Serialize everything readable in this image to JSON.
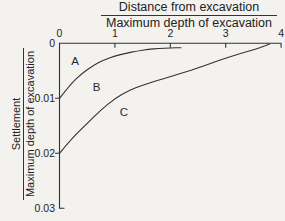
{
  "figure": {
    "x_axis_title_numerator": "Distance from excavation",
    "x_axis_title_denominator": "Maximum depth of excavation",
    "y_axis_title_numerator": "Settlement",
    "y_axis_title_denominator": "Maximum depth of excavation"
  },
  "colors": {
    "background": "#f3f2ef",
    "line": "#333333",
    "text": "#222222"
  },
  "chart_data": {
    "type": "line",
    "xlabel": "Distance from excavation / Maximum depth of excavation",
    "ylabel": "Settlement / Maximum depth of excavation",
    "xlim": [
      0,
      4
    ],
    "ylim": [
      0,
      0.03
    ],
    "x_axis_position": "top",
    "y_axis_inverted": true,
    "grid": false,
    "legend": "none",
    "x_tick_values": [
      0,
      1,
      2,
      3,
      4
    ],
    "x_tick_labels": [
      "0",
      "1",
      "2",
      "3",
      "4"
    ],
    "y_tick_values": [
      0,
      0.01,
      0.02,
      0.03
    ],
    "y_tick_labels": [
      "0",
      "0.01",
      "0.02",
      "0.03"
    ],
    "x_ticks_with_marks": [
      1,
      2,
      3,
      4
    ],
    "y_ticks_with_marks": [
      0.01,
      0.02
    ],
    "series": [
      {
        "name": "zone-boundary-A-B",
        "points": [
          [
            0,
            0.01
          ],
          [
            0.2,
            0.0074
          ],
          [
            0.4,
            0.0055
          ],
          [
            0.6,
            0.0041
          ],
          [
            0.8,
            0.003
          ],
          [
            1.0,
            0.0023
          ],
          [
            1.2,
            0.0018
          ],
          [
            1.4,
            0.0014
          ],
          [
            1.6,
            0.0011
          ],
          [
            1.8,
            0.00095
          ],
          [
            2.0,
            0.00085
          ],
          [
            2.2,
            0.0008
          ]
        ]
      },
      {
        "name": "zone-boundary-B-C",
        "points": [
          [
            0,
            0.02
          ],
          [
            0.25,
            0.017
          ],
          [
            0.5,
            0.0146
          ],
          [
            0.75,
            0.0121
          ],
          [
            1.0,
            0.01
          ],
          [
            1.25,
            0.0086
          ],
          [
            1.5,
            0.0076
          ],
          [
            1.75,
            0.0068
          ],
          [
            2.0,
            0.0061
          ],
          [
            2.25,
            0.0053
          ],
          [
            2.5,
            0.0045
          ],
          [
            2.75,
            0.0036
          ],
          [
            3.0,
            0.0027
          ],
          [
            3.25,
            0.0019
          ],
          [
            3.5,
            0.0012
          ],
          [
            3.65,
            0.0007
          ],
          [
            3.8,
            0.0001
          ]
        ]
      }
    ],
    "annotations": [
      {
        "label": "A",
        "x": 0.28,
        "y": 0.0033
      },
      {
        "label": "B",
        "x": 0.67,
        "y": 0.008
      },
      {
        "label": "C",
        "x": 1.16,
        "y": 0.0125
      }
    ]
  }
}
